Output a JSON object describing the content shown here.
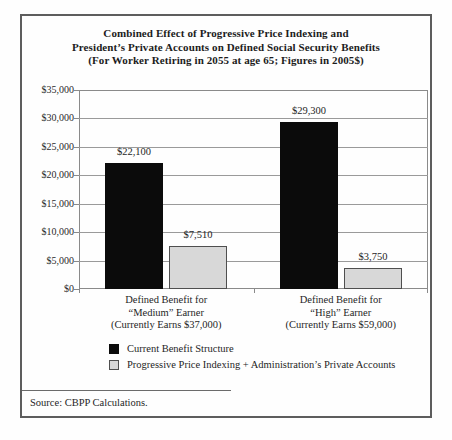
{
  "panel": {
    "title_lines": [
      "Combined Effect of Progressive Price Indexing and",
      "President’s Private Accounts on Defined Social Security Benefits",
      "(For Worker Retiring in 2055 at age 65; Figures in 2005$)"
    ],
    "source": "Source: CBPP Calculations."
  },
  "colors": {
    "panel_border": "#5d5d5d",
    "plot_frame": "#8a8a8a",
    "gridline": "#9a9a9a",
    "text": "#1f1f1f"
  },
  "chart_data": {
    "type": "bar",
    "title": "Combined Effect of Progressive Price Indexing and President’s Private Accounts on Defined Social Security Benefits (For Worker Retiring in 2055 at age 65; Figures in 2005$)",
    "categories": [
      {
        "lines": [
          "Defined Benefit for",
          "“Medium” Earner",
          "(Currently Earns $37,000)"
        ]
      },
      {
        "lines": [
          "Defined Benefit for",
          "“High” Earner",
          "(Currently Earns $59,000)"
        ]
      }
    ],
    "series": [
      {
        "name": "Current Benefit Structure",
        "values": [
          22100,
          29300
        ],
        "labels": [
          "$22,100",
          "$29,300"
        ],
        "color": "#0b0b0b",
        "border": "#0b0b0b"
      },
      {
        "name": "Progressive Price Indexing + Administration’s Private Accounts",
        "values": [
          7510,
          3750
        ],
        "labels": [
          "$7,510",
          "$3,750"
        ],
        "color": "#d8d8d8",
        "border": "#4f4f4f"
      }
    ],
    "xlabel": "",
    "ylabel": "",
    "ylim": [
      0,
      35000
    ],
    "ytick_interval": 5000,
    "ytick_labels": [
      "$0",
      "$5,000",
      "$10,000",
      "$15,000",
      "$20,000",
      "$25,000",
      "$30,000",
      "$35,000"
    ],
    "grid": true,
    "legend_position": "bottom",
    "source": "Source: CBPP Calculations."
  }
}
